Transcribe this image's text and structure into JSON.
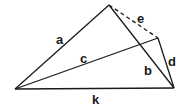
{
  "diagram": {
    "type": "geometric-figure",
    "vertices": [
      {
        "id": "A",
        "label": ""
      },
      {
        "id": "B",
        "label": ""
      },
      {
        "id": "C",
        "label": ""
      },
      {
        "id": "D",
        "label": ""
      }
    ],
    "edges": [
      {
        "id": "a",
        "label": "a",
        "from": "A",
        "to": "B",
        "style": "solid"
      },
      {
        "id": "b",
        "label": "b",
        "from": "B",
        "to": "D",
        "style": "solid"
      },
      {
        "id": "c",
        "label": "c",
        "from": "A",
        "to": "C",
        "style": "solid"
      },
      {
        "id": "d",
        "label": "d",
        "from": "C",
        "to": "D",
        "style": "solid"
      },
      {
        "id": "e",
        "label": "e",
        "from": "B",
        "to": "C",
        "style": "dashed"
      },
      {
        "id": "k",
        "label": "k",
        "from": "A",
        "to": "D",
        "style": "solid"
      }
    ]
  }
}
